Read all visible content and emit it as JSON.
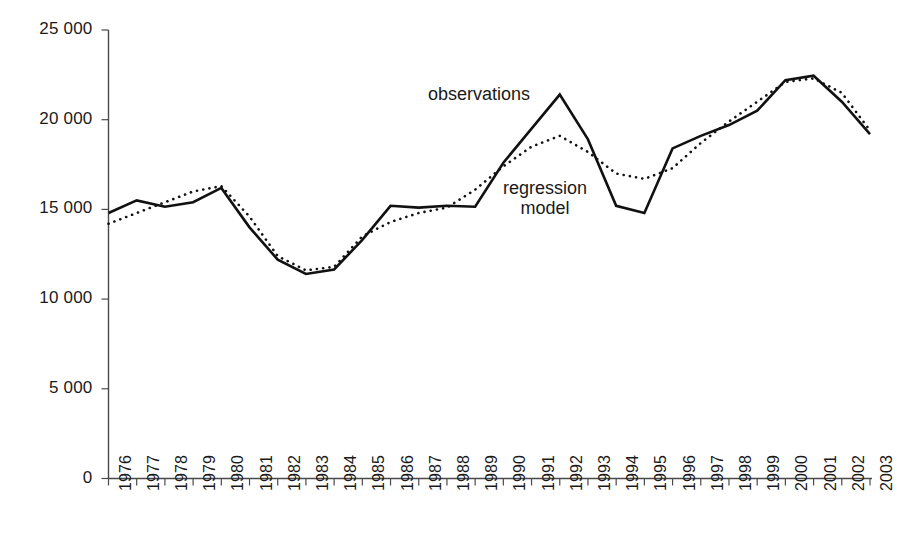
{
  "chart_data": {
    "type": "line",
    "title": "",
    "subtitle": "",
    "xlabel": "",
    "ylabel": "",
    "grid": false,
    "legend_position": "inline-annotations",
    "xlim": [
      1976,
      2003
    ],
    "ylim": [
      0,
      25000
    ],
    "ytick_step": 5000,
    "categories": [
      "1976",
      "1977",
      "1978",
      "1979",
      "1980",
      "1981",
      "1982",
      "1983",
      "1984",
      "1985",
      "1986",
      "1987",
      "1988",
      "1989",
      "1990",
      "1991",
      "1992",
      "1993",
      "1994",
      "1995",
      "1996",
      "1997",
      "1998",
      "1999",
      "2000",
      "2001",
      "2002",
      "2003"
    ],
    "ytick_labels": [
      "0",
      "5 000",
      "10 000",
      "15 000",
      "20 000",
      "25 000"
    ],
    "ytick_values": [
      0,
      5000,
      10000,
      15000,
      20000,
      25000
    ],
    "series": [
      {
        "name": "observations",
        "style": "solid",
        "color": "#111111",
        "values": [
          14800,
          15500,
          15150,
          15400,
          16200,
          14000,
          12200,
          11400,
          11650,
          13300,
          15200,
          15100,
          15200,
          15150,
          17600,
          19500,
          21400,
          18900,
          15200,
          14800,
          18400,
          19100,
          19700,
          20500,
          22200,
          22450,
          21000,
          19200
        ]
      },
      {
        "name": "regression model",
        "style": "dotted",
        "color": "#111111",
        "values": [
          14200,
          14800,
          15400,
          16000,
          16300,
          14600,
          12400,
          11600,
          11800,
          13500,
          14300,
          14800,
          15100,
          16100,
          17400,
          18500,
          19100,
          18200,
          17000,
          16700,
          17300,
          18700,
          19900,
          21000,
          22100,
          22300,
          21500,
          19400
        ]
      }
    ],
    "annotations": [
      {
        "id": "observations",
        "text": "observations",
        "lines": [
          "observations"
        ]
      },
      {
        "id": "regression",
        "text": "regression model",
        "lines": [
          "regression",
          "model"
        ]
      }
    ]
  },
  "axes": {
    "y_axis_name": "value-axis",
    "x_axis_name": "year-axis"
  }
}
